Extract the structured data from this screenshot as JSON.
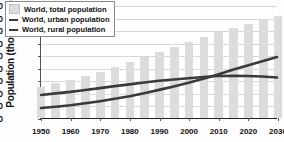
{
  "chart_data": {
    "type": "bar",
    "title": "",
    "xlabel": "",
    "ylabel": "Population (thousands)",
    "ylim": [
      0,
      9
    ],
    "ytick_labels": [
      "0.0",
      "1.0",
      "2.0",
      "3.0",
      "4.0",
      "5.0",
      "6.0",
      "7.0",
      "8.0",
      "9.0"
    ],
    "ytick_values": [
      0,
      1,
      2,
      3,
      4,
      5,
      6,
      7,
      8,
      9
    ],
    "xlim": [
      1950,
      2030
    ],
    "xtick_labels": [
      "1950",
      "1960",
      "1970",
      "1980",
      "1990",
      "2000",
      "2010",
      "2020",
      "2030"
    ],
    "xtick_values": [
      1950,
      1960,
      1970,
      1980,
      1990,
      2000,
      2010,
      2020,
      2030
    ],
    "grid": true,
    "legend_position": "upper-left",
    "categories": [
      1950,
      1955,
      1960,
      1965,
      1970,
      1975,
      1980,
      1985,
      1990,
      1995,
      2000,
      2005,
      2010,
      2015,
      2020,
      2025,
      2030
    ],
    "series": [
      {
        "name": "World, total population",
        "type": "bar",
        "color": "#dcdcdc",
        "values": [
          2.5,
          2.75,
          3.02,
          3.33,
          3.69,
          4.07,
          4.43,
          4.83,
          5.27,
          5.67,
          6.07,
          6.45,
          6.83,
          7.2,
          7.5,
          7.82,
          8.1
        ]
      },
      {
        "name": "World, urban population",
        "type": "line",
        "color": "#3a3a3a",
        "values": [
          0.8,
          0.9,
          1.02,
          1.18,
          1.35,
          1.54,
          1.75,
          1.99,
          2.26,
          2.54,
          2.84,
          3.15,
          3.5,
          3.88,
          4.22,
          4.56,
          4.9
        ]
      },
      {
        "name": "World, rural population",
        "type": "line",
        "color": "#3a3a3a",
        "values": [
          1.85,
          1.98,
          2.1,
          2.25,
          2.4,
          2.56,
          2.7,
          2.85,
          2.99,
          3.1,
          3.2,
          3.3,
          3.37,
          3.4,
          3.38,
          3.33,
          3.25
        ]
      }
    ]
  },
  "legend": {
    "entries": [
      {
        "label": "World, total population",
        "marker": "box"
      },
      {
        "label": "World, urban population",
        "marker": "line"
      },
      {
        "label": "World, rural population",
        "marker": "line"
      }
    ]
  }
}
